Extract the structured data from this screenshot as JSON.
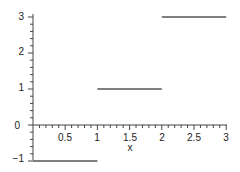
{
  "chart_data": {
    "type": "line",
    "title": "",
    "xlabel": "x",
    "ylabel": "",
    "xlim": [
      0,
      3
    ],
    "ylim": [
      -1,
      3
    ],
    "grid": false,
    "legend": null,
    "x_ticks": [
      "0.5",
      "1",
      "1.5",
      "2",
      "2.5",
      "3"
    ],
    "y_ticks": [
      "-1",
      "0",
      "1",
      "2",
      "3"
    ],
    "series": [
      {
        "name": "step function",
        "segments": [
          {
            "x": [
              0,
              1
            ],
            "y": [
              -1,
              -1
            ]
          },
          {
            "x": [
              1,
              2
            ],
            "y": [
              1,
              1
            ]
          },
          {
            "x": [
              2,
              3
            ],
            "y": [
              3,
              3
            ]
          }
        ],
        "color": "#555555"
      }
    ]
  },
  "labels": {
    "x_axis": "x",
    "x_ticks": [
      "0.5",
      "1",
      "1.5",
      "2",
      "2.5",
      "3"
    ],
    "y_ticks": [
      "3",
      "2",
      "1",
      "0",
      "−1"
    ]
  }
}
